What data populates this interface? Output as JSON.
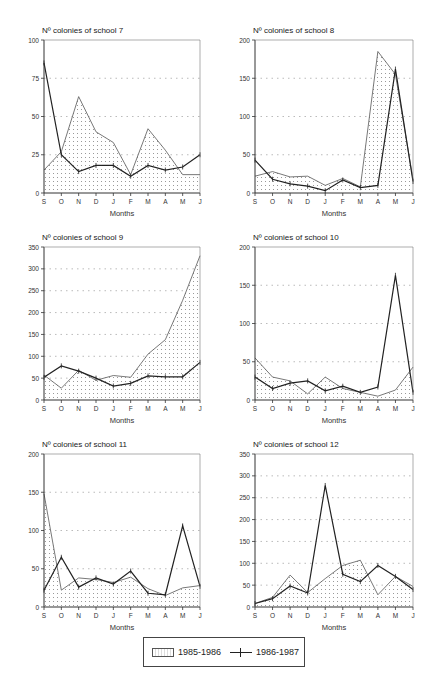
{
  "chart_data": [
    {
      "type": "line",
      "title": "Nº colonies of school 7",
      "xlabel": "Months",
      "ylabel": "",
      "categories": [
        "S",
        "O",
        "N",
        "D",
        "J",
        "F",
        "M",
        "A",
        "M",
        "J"
      ],
      "ylim": [
        0,
        100
      ],
      "yticks": [
        0,
        25,
        50,
        75,
        100
      ],
      "grid": true,
      "series": [
        {
          "name": "1985-1986",
          "style": "shaded",
          "values": [
            15,
            27,
            63,
            40,
            33,
            12,
            42,
            28,
            12,
            12
          ]
        },
        {
          "name": "1986-1987",
          "style": "line-cross",
          "values": [
            85,
            25,
            14,
            18,
            18,
            11,
            18,
            15,
            17,
            25
          ]
        }
      ]
    },
    {
      "type": "line",
      "title": "Nº colonies of school 8",
      "xlabel": "Months",
      "ylabel": "",
      "categories": [
        "S",
        "O",
        "N",
        "D",
        "J",
        "F",
        "M",
        "A",
        "M",
        "J"
      ],
      "ylim": [
        0,
        200
      ],
      "yticks": [
        0,
        50,
        100,
        150,
        200
      ],
      "grid": true,
      "series": [
        {
          "name": "1985-1986",
          "style": "shaded",
          "values": [
            22,
            28,
            21,
            22,
            10,
            19,
            8,
            185,
            155,
            18
          ]
        },
        {
          "name": "1986-1987",
          "style": "line-cross",
          "values": [
            43,
            18,
            12,
            9,
            3,
            17,
            7,
            10,
            162,
            15
          ]
        }
      ]
    },
    {
      "type": "line",
      "title": "Nº colonies of school 9",
      "xlabel": "Months",
      "ylabel": "",
      "categories": [
        "S",
        "O",
        "N",
        "D",
        "J",
        "F",
        "M",
        "A",
        "M",
        "J"
      ],
      "ylim": [
        0,
        350
      ],
      "yticks": [
        0,
        50,
        100,
        150,
        200,
        250,
        300,
        350
      ],
      "grid": true,
      "series": [
        {
          "name": "1985-1986",
          "style": "shaded",
          "values": [
            57,
            27,
            68,
            45,
            56,
            52,
            105,
            138,
            228,
            330
          ]
        },
        {
          "name": "1986-1987",
          "style": "line-cross",
          "values": [
            52,
            78,
            66,
            50,
            32,
            38,
            55,
            53,
            53,
            86
          ]
        }
      ]
    },
    {
      "type": "line",
      "title": "Nº colonies of school 10",
      "xlabel": "Months",
      "ylabel": "",
      "categories": [
        "S",
        "O",
        "N",
        "D",
        "J",
        "F",
        "M",
        "A",
        "M",
        "J"
      ],
      "ylim": [
        0,
        200
      ],
      "yticks": [
        0,
        50,
        100,
        150,
        200
      ],
      "grid": true,
      "series": [
        {
          "name": "1985-1986",
          "style": "shaded",
          "values": [
            55,
            30,
            25,
            8,
            30,
            15,
            10,
            5,
            13,
            43
          ]
        },
        {
          "name": "1986-1987",
          "style": "line-cross",
          "values": [
            30,
            15,
            22,
            25,
            12,
            18,
            10,
            17,
            163,
            10
          ]
        }
      ]
    },
    {
      "type": "line",
      "title": "Nº colonies of school 11",
      "xlabel": "Months",
      "ylabel": "",
      "categories": [
        "S",
        "O",
        "N",
        "D",
        "J",
        "F",
        "M",
        "A",
        "M",
        "J"
      ],
      "ylim": [
        0,
        200
      ],
      "yticks": [
        0,
        50,
        100,
        150,
        200
      ],
      "grid": true,
      "series": [
        {
          "name": "1985-1986",
          "style": "shaded",
          "values": [
            148,
            22,
            38,
            36,
            32,
            39,
            24,
            15,
            25,
            28
          ]
        },
        {
          "name": "1986-1987",
          "style": "line-cross",
          "values": [
            22,
            65,
            26,
            38,
            30,
            47,
            18,
            16,
            106,
            27
          ]
        }
      ]
    },
    {
      "type": "line",
      "title": "Nº colonies of school 12",
      "xlabel": "Months",
      "ylabel": "",
      "categories": [
        "S",
        "O",
        "N",
        "D",
        "J",
        "F",
        "M",
        "A",
        "M",
        "J"
      ],
      "ylim": [
        0,
        350
      ],
      "yticks": [
        0,
        50,
        100,
        150,
        200,
        250,
        300,
        350
      ],
      "grid": true,
      "series": [
        {
          "name": "1985-1986",
          "style": "shaded",
          "values": [
            8,
            22,
            73,
            33,
            65,
            95,
            107,
            28,
            70,
            47
          ]
        },
        {
          "name": "1986-1987",
          "style": "line-cross",
          "values": [
            8,
            19,
            48,
            32,
            278,
            75,
            58,
            95,
            70,
            40
          ]
        }
      ]
    }
  ],
  "legend": {
    "items": [
      {
        "label": "1985-1986",
        "symbol": "shaded-box"
      },
      {
        "label": "1986-1987",
        "symbol": "line-cross"
      }
    ]
  },
  "colors": {
    "line": "#222222",
    "shade": "#d8d8d8",
    "grid": "#aaaaaa"
  }
}
